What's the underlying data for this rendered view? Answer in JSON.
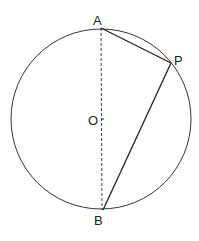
{
  "diagram": {
    "title": "",
    "colors": {
      "stroke": "#333333",
      "background": "#ffffff"
    },
    "circle": {
      "center_label": "O",
      "cx": 101,
      "cy": 119,
      "r": 90
    },
    "points": {
      "A": {
        "label": "A",
        "x": 101,
        "y": 28
      },
      "B": {
        "label": "B",
        "x": 103,
        "y": 210
      },
      "P": {
        "label": "P",
        "x": 171,
        "y": 63
      }
    },
    "segments": [
      {
        "from": "A",
        "to": "B",
        "style": "dashed",
        "note": "diameter"
      },
      {
        "from": "A",
        "to": "P",
        "style": "solid"
      },
      {
        "from": "P",
        "to": "B",
        "style": "solid"
      }
    ]
  }
}
